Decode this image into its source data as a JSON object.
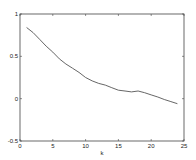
{
  "chart_data": {
    "type": "line",
    "title": "",
    "xlabel": "k",
    "ylabel": "",
    "xlim": [
      0,
      25
    ],
    "ylim": [
      -0.5,
      1
    ],
    "grid": false,
    "legend": null,
    "x_ticks": [
      0,
      5,
      10,
      15,
      20,
      25
    ],
    "x_tick_labels": [
      "0",
      "5",
      "10",
      "15",
      "20",
      "25"
    ],
    "y_ticks": [
      -0.5,
      0,
      0.5,
      1
    ],
    "y_tick_labels": [
      "-0.5",
      "0",
      "0.5",
      "1"
    ],
    "series": [
      {
        "name": "series-1",
        "color": "#555555",
        "x": [
          1,
          2,
          3,
          4,
          5,
          6,
          7,
          8,
          9,
          10,
          11,
          12,
          13,
          14,
          15,
          16,
          17,
          18,
          19,
          20,
          21,
          22,
          23,
          24
        ],
        "values": [
          0.84,
          0.78,
          0.7,
          0.62,
          0.55,
          0.47,
          0.41,
          0.36,
          0.31,
          0.25,
          0.21,
          0.18,
          0.16,
          0.13,
          0.1,
          0.09,
          0.08,
          0.09,
          0.07,
          0.045,
          0.02,
          -0.01,
          -0.035,
          -0.06
        ]
      }
    ]
  }
}
